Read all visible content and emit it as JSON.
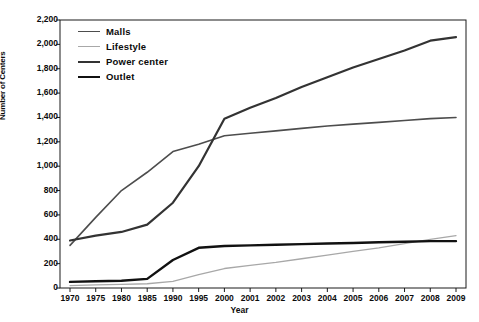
{
  "chart_data": {
    "type": "line",
    "title": "",
    "xlabel": "Year",
    "ylabel": "Number of Centers",
    "categories": [
      "1970",
      "1975",
      "1980",
      "1985",
      "1990",
      "1995",
      "2000",
      "2001",
      "2002",
      "2003",
      "2004",
      "2005",
      "2006",
      "2007",
      "2008",
      "2009"
    ],
    "ylim": [
      0,
      2200
    ],
    "ytick_labels": [
      "2,200",
      "2,000",
      "1,800",
      "1,600",
      "1,400",
      "1,200",
      "1,000",
      "800",
      "600",
      "400",
      "200",
      "0"
    ],
    "ytick_values": [
      2200,
      2000,
      1800,
      1600,
      1400,
      1200,
      1000,
      800,
      600,
      400,
      200,
      0
    ],
    "grid": false,
    "legend_position": "top-left",
    "series": [
      {
        "name": "Malls",
        "color": "#4d4d4d",
        "values": [
          350,
          580,
          800,
          950,
          1120,
          1180,
          1250,
          1270,
          1290,
          1310,
          1330,
          1345,
          1360,
          1375,
          1390,
          1400
        ]
      },
      {
        "name": "Lifestyle",
        "color": "#a8a8a8",
        "values": [
          20,
          25,
          30,
          35,
          55,
          110,
          160,
          185,
          210,
          240,
          270,
          300,
          330,
          365,
          400,
          430
        ]
      },
      {
        "name": "Power center",
        "color": "#333333",
        "values": [
          390,
          430,
          460,
          520,
          700,
          1000,
          1390,
          1480,
          1560,
          1650,
          1730,
          1810,
          1880,
          1950,
          2030,
          2060
        ]
      },
      {
        "name": "Outlet",
        "color": "#111111",
        "values": [
          50,
          55,
          60,
          75,
          230,
          330,
          345,
          350,
          355,
          360,
          365,
          370,
          375,
          380,
          385,
          385
        ]
      }
    ]
  },
  "legend": {
    "items": [
      {
        "label": "Malls"
      },
      {
        "label": "Lifestyle"
      },
      {
        "label": "Power center"
      },
      {
        "label": "Outlet"
      }
    ]
  }
}
